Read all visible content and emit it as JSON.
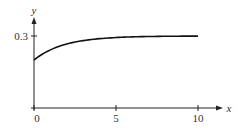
{
  "chart_data": {
    "type": "line",
    "title": "",
    "xlabel": "x",
    "ylabel": "y",
    "xlim": [
      0,
      10
    ],
    "ylim": [
      0,
      0.3
    ],
    "x_ticks": [
      0,
      5,
      10
    ],
    "x_tick_labels": [
      "0",
      "5",
      "10"
    ],
    "y_ticks": [
      0.3
    ],
    "y_tick_labels": [
      "0.3"
    ],
    "grid": false,
    "legend": null,
    "series": [
      {
        "name": "y(x)",
        "x": [
          0,
          1,
          2,
          3,
          4,
          5,
          6,
          7,
          8,
          9,
          10
        ],
        "values": [
          0.2,
          0.24,
          0.263,
          0.278,
          0.286,
          0.292,
          0.295,
          0.297,
          0.298,
          0.299,
          0.3
        ]
      }
    ]
  },
  "layout": {
    "origin_px": [
      34,
      108
    ],
    "x_px_per_unit": 16.4,
    "y_px_per_unit": 240
  }
}
